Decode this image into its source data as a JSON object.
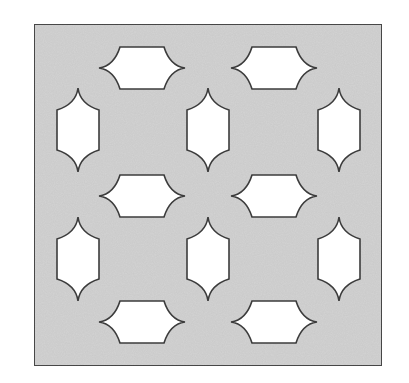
{
  "diagram": {
    "colors": {
      "background": "#ffffff",
      "panel_fill": "#d3d3d3",
      "panel_border": "#4a4a4a",
      "cutout_fill": "#ffffff",
      "cutout_stroke": "#3c3c3c"
    },
    "panel": {
      "x": 34,
      "y": 24,
      "width": 348,
      "height": 342
    },
    "shape_geometry": {
      "horizontal": {
        "tip_half_width": 43,
        "flat_half_width": 22,
        "half_height": 21
      },
      "vertical": {
        "tip_half_height": 42,
        "flat_half_height": 20,
        "half_width": 21
      }
    },
    "horizontal_cutouts": [
      {
        "cx": 142,
        "cy": 68
      },
      {
        "cx": 274,
        "cy": 68
      },
      {
        "cx": 142,
        "cy": 196
      },
      {
        "cx": 274,
        "cy": 196
      },
      {
        "cx": 142,
        "cy": 322
      },
      {
        "cx": 274,
        "cy": 322
      }
    ],
    "vertical_cutouts": [
      {
        "cx": 78,
        "cy": 130
      },
      {
        "cx": 208,
        "cy": 130
      },
      {
        "cx": 339,
        "cy": 130
      },
      {
        "cx": 78,
        "cy": 259
      },
      {
        "cx": 208,
        "cy": 259
      },
      {
        "cx": 339,
        "cy": 259
      }
    ]
  }
}
